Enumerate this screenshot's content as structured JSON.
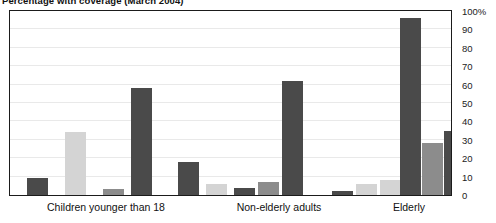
{
  "chart_data": {
    "type": "bar",
    "title": "Percentage with coverage (March 2004)",
    "xlabel": "",
    "ylabel": "",
    "ylim": [
      0,
      100
    ],
    "yticks": [
      0,
      10,
      20,
      30,
      40,
      50,
      60,
      70,
      80,
      90,
      100
    ],
    "ytick_labels": [
      "0",
      "10",
      "20",
      "30",
      "40",
      "50",
      "60",
      "70",
      "80",
      "90",
      "100%"
    ],
    "ytick_suffix": "%",
    "axis_position": "right",
    "grid": true,
    "legend": "none",
    "categories": [
      "Children younger than 18",
      "Non-elderly adults",
      "Elderly"
    ],
    "series": [
      {
        "name": "series-1",
        "color": "#4a4a4a",
        "values": [
          9,
          18,
          2
        ]
      },
      {
        "name": "series-2",
        "color": "#d4d4d4",
        "values": [
          0,
          6,
          6
        ]
      },
      {
        "name": "series-3",
        "color": "#d4d4d4",
        "values": [
          34,
          0,
          8
        ]
      },
      {
        "name": "series-4",
        "color": "#8c8c8c",
        "values": [
          0,
          4,
          0
        ]
      },
      {
        "name": "series-5",
        "color": "#4a4a4a",
        "values": [
          3,
          7,
          96
        ]
      },
      {
        "name": "series-6",
        "color": "#8c8c8c",
        "values": [
          0,
          0,
          28
        ]
      },
      {
        "name": "series-7",
        "color": "#4a4a4a",
        "values": [
          58,
          62,
          35
        ]
      }
    ],
    "bars": [
      {
        "group": 0,
        "x": 17,
        "w": 21,
        "value": 9,
        "color": "#4a4a4a"
      },
      {
        "group": 0,
        "x": 55,
        "w": 21,
        "value": 34,
        "color": "#d4d4d4"
      },
      {
        "group": 0,
        "x": 93,
        "w": 21,
        "value": 3,
        "color": "#8c8c8c"
      },
      {
        "group": 0,
        "x": 121,
        "w": 21,
        "value": 58,
        "color": "#4a4a4a"
      },
      {
        "group": 1,
        "x": 168,
        "w": 21,
        "value": 18,
        "color": "#4a4a4a"
      },
      {
        "group": 1,
        "x": 196,
        "w": 21,
        "value": 6,
        "color": "#d4d4d4"
      },
      {
        "group": 1,
        "x": 224,
        "w": 21,
        "value": 4,
        "color": "#4a4a4a"
      },
      {
        "group": 1,
        "x": 248,
        "w": 21,
        "value": 7,
        "color": "#8c8c8c"
      },
      {
        "group": 1,
        "x": 272,
        "w": 21,
        "value": 62,
        "color": "#4a4a4a"
      },
      {
        "group": 2,
        "x": 322,
        "w": 21,
        "value": 2,
        "color": "#4a4a4a"
      },
      {
        "group": 2,
        "x": 346,
        "w": 21,
        "value": 6,
        "color": "#d4d4d4"
      },
      {
        "group": 2,
        "x": 370,
        "w": 21,
        "value": 8,
        "color": "#d4d4d4"
      },
      {
        "group": 2,
        "x": 390,
        "w": 21,
        "value": 96,
        "color": "#4a4a4a"
      },
      {
        "group": 2,
        "x": 412,
        "w": 21,
        "value": 28,
        "color": "#8c8c8c"
      },
      {
        "group": 2,
        "x": 434,
        "w": 21,
        "value": 35,
        "color": "#4a4a4a"
      }
    ],
    "group_label_centers": [
      97,
      270,
      400
    ]
  }
}
